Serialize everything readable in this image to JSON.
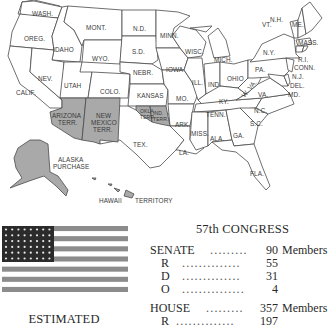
{
  "map": {
    "states": {
      "wash": "WASH.",
      "oreg": "OREG.",
      "calif": "CALIF.",
      "idaho": "IDAHO",
      "nev": "NEV.",
      "mont": "MONT.",
      "wyo": "WYO.",
      "utah": "UTAH",
      "colo": "COLO.",
      "nd": "N.D.",
      "sd": "S.D.",
      "nebr": "NEBR.",
      "kansas": "KANSAS",
      "tex": "TEX.",
      "minn": "MINN.",
      "iowa": "IOWA",
      "mo": "MO.",
      "ark": "ARK.",
      "la": "LA.",
      "wisc": "WISC.",
      "ill": "ILL.",
      "mich": "MICH.",
      "ind": "IND.",
      "ohio": "OHIO",
      "ky": "KY.",
      "tenn": "TENN.",
      "miss": "MISS.",
      "ala": "ALA.",
      "ga": "GA.",
      "fla": "FLA.",
      "sc": "S.C.",
      "nc": "N.C.",
      "va": "VA.",
      "wva": "W. VA.",
      "pa": "PA.",
      "ny": "N.Y.",
      "vt": "VT.",
      "nh": "N.H.",
      "me": "ME.",
      "mass": "MASS.",
      "ri": "R.I.",
      "conn": "CONN.",
      "nj": "N.J.",
      "del": "DEL.",
      "md": "MD."
    },
    "territories": {
      "arizona_1": "ARIZONA",
      "arizona_2": "TERR.",
      "newmexico_1": "NEW",
      "newmexico_2": "MEXICO",
      "newmexico_3": "TERR.",
      "okla_1": "OKLA.",
      "okla_2": "TERR.",
      "ind_1": "IND.",
      "ind_2": "TERR.",
      "alaska_1": "ALASKA",
      "alaska_2": "PURCHASE",
      "hawaii_1": "HAWAII",
      "hawaii_2": "TERRITORY"
    },
    "colors": {
      "state_fill": "#ffffff",
      "territory_fill": "#a9a9a9",
      "border": "#4a4a4a"
    }
  },
  "flag": {
    "stars_rows": 6,
    "stars_per_row": 8,
    "stripes": 13,
    "color_dark": "#2b2b2b",
    "color_stripe": "#8c8c8c"
  },
  "estimated_label": "ESTIMATED",
  "congress": {
    "title": "57th CONGRESS",
    "senate": {
      "label": "SENATE",
      "dots": ".........",
      "total": "90",
      "unit": "Members",
      "rows": [
        {
          "party": "R",
          "dots": "..............",
          "value": "55"
        },
        {
          "party": "D",
          "dots": "..............",
          "value": "31"
        },
        {
          "party": "O",
          "dots": "...............",
          "value": "4"
        }
      ]
    },
    "house": {
      "label": "HOUSE",
      "dots": ".........",
      "total": "357",
      "unit": "Members",
      "rows": [
        {
          "party": "R",
          "dots": "..............",
          "value": "197"
        }
      ]
    }
  }
}
